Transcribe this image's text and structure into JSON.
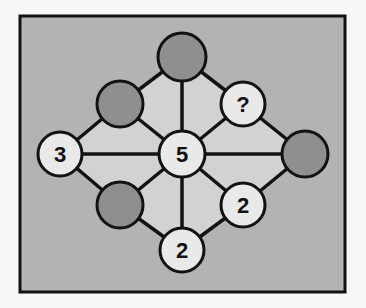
{
  "puzzle": {
    "colors": {
      "background": "#f7f7f5",
      "board_fill": "#b3b3b3",
      "inner_fill": "#d2d2d2",
      "line": "#121212",
      "filled_node": "#8f8f8f",
      "empty_node": "#e9e9e9"
    },
    "nodes": [
      {
        "id": "top",
        "x": 182,
        "y": 57,
        "r": 24,
        "type": "filled",
        "label": ""
      },
      {
        "id": "upper-left",
        "x": 120,
        "y": 104,
        "r": 23,
        "type": "filled",
        "label": ""
      },
      {
        "id": "upper-right",
        "x": 243,
        "y": 104,
        "r": 22,
        "type": "number",
        "label": "?"
      },
      {
        "id": "left",
        "x": 60,
        "y": 154,
        "r": 22,
        "type": "number",
        "label": "3"
      },
      {
        "id": "center",
        "x": 182,
        "y": 154,
        "r": 23,
        "type": "number",
        "label": "5"
      },
      {
        "id": "right",
        "x": 305,
        "y": 154,
        "r": 23,
        "type": "filled",
        "label": ""
      },
      {
        "id": "lower-left",
        "x": 120,
        "y": 205,
        "r": 23,
        "type": "filled",
        "label": ""
      },
      {
        "id": "lower-right",
        "x": 243,
        "y": 205,
        "r": 22,
        "type": "number",
        "label": "2"
      },
      {
        "id": "bottom",
        "x": 182,
        "y": 250,
        "r": 22,
        "type": "number",
        "label": "2"
      }
    ],
    "edges": [
      [
        "top",
        "upper-left"
      ],
      [
        "top",
        "upper-right"
      ],
      [
        "top",
        "center"
      ],
      [
        "upper-left",
        "left"
      ],
      [
        "upper-left",
        "center"
      ],
      [
        "upper-right",
        "right"
      ],
      [
        "upper-right",
        "center"
      ],
      [
        "left",
        "center"
      ],
      [
        "center",
        "right"
      ],
      [
        "left",
        "lower-left"
      ],
      [
        "lower-left",
        "center"
      ],
      [
        "lower-left",
        "bottom"
      ],
      [
        "right",
        "lower-right"
      ],
      [
        "lower-right",
        "center"
      ],
      [
        "lower-right",
        "bottom"
      ],
      [
        "center",
        "bottom"
      ]
    ]
  }
}
